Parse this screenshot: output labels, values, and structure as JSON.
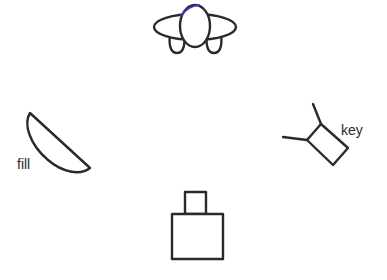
{
  "diagram": {
    "elements": [
      {
        "id": "subject",
        "kind": "top-view-person-icon"
      },
      {
        "id": "fill",
        "kind": "softbox-half-disc",
        "label": "fill"
      },
      {
        "id": "key",
        "kind": "light-with-stand",
        "label": "key"
      },
      {
        "id": "camera",
        "kind": "camera-icon"
      }
    ],
    "labels": {
      "fill": "fill",
      "key": "key"
    },
    "colors": {
      "stroke": "#2a2a2a",
      "background": "#ffffff",
      "accent_blue": "#3a3ad0"
    }
  }
}
